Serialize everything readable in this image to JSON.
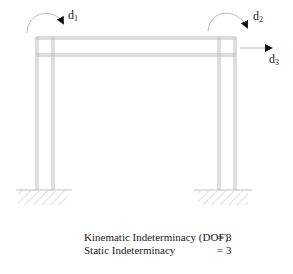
{
  "diagram": {
    "type": "portal-frame",
    "colors": {
      "frame": "#bdbdbd",
      "arrow": "#111111",
      "text": "#222222"
    },
    "labels": {
      "d1": {
        "base": "d",
        "sub": "1"
      },
      "d2": {
        "base": "d",
        "sub": "2"
      },
      "d3": {
        "base": "d",
        "sub": "3"
      }
    },
    "supports": [
      "fixed-left",
      "fixed-right"
    ]
  },
  "results": {
    "rows": [
      {
        "label": "Kinematic Indeterminacy (DOF)",
        "value": "= 3"
      },
      {
        "label": "Static Indeterminacy",
        "value": "= 3"
      }
    ]
  }
}
